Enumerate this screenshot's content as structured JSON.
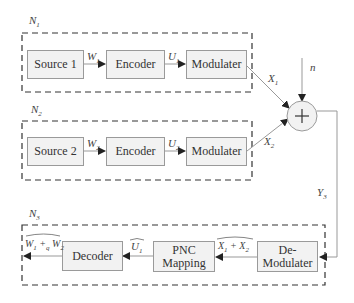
{
  "diagram": {
    "type": "block-diagram",
    "topic": "Physical-layer Network Coding (PNC) system model",
    "nodes": {
      "n1": {
        "label": "N1",
        "blocks": [
          "Source 1",
          "Encoder",
          "Modulater"
        ],
        "signals": {
          "w": "W",
          "w_sub": "1",
          "u": "U",
          "u_sub": "1",
          "x": "X",
          "x_sub": "1"
        }
      },
      "n2": {
        "label": "N2",
        "blocks": [
          "Source 2",
          "Encoder",
          "Modulater"
        ],
        "signals": {
          "w": "W",
          "w_sub": "2",
          "u": "U",
          "u_sub": "2",
          "x": "X",
          "x_sub": "2"
        }
      },
      "n3": {
        "label": "N3",
        "blocks": [
          "Decoder",
          "PNC Mapping",
          "De-Modulater"
        ],
        "signals": {
          "out": "W₁ +ₒ W₂",
          "out_a": "W",
          "out_a_sub": "1",
          "out_op": " +",
          "out_op_sub": "q",
          "out_b": " W",
          "out_b_sub": "2",
          "u": "U",
          "u_sub": "1",
          "x_a": "X",
          "x_a_sub": "1",
          "x_op": " + ",
          "x_b": "X",
          "x_b_sub": "2"
        }
      }
    },
    "channel": {
      "noise_label": "n",
      "adder_symbol": "+",
      "output_label": "Y",
      "output_sub": "3"
    },
    "node_labels": {
      "n1_main": "N",
      "n1_sub": "1",
      "n2_main": "N",
      "n2_sub": "2",
      "n3_main": "N",
      "n3_sub": "3"
    },
    "colors": {
      "block_fill": "#f2f2f2",
      "block_border": "#9a9a9a",
      "dashed_border": "#333333",
      "line": "#999999",
      "arrow": "#222222"
    }
  }
}
